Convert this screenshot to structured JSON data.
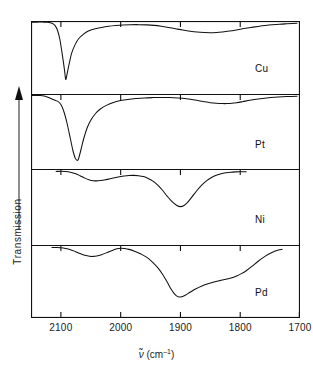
{
  "figure": {
    "y_axis_label": "Transmission",
    "x_axis_symbol": "ν",
    "x_axis_unit_open": " (cm",
    "x_axis_unit_exp": "–1",
    "x_axis_unit_close": ")",
    "x_axis_full": "ν̃ (cm–1)"
  },
  "chart_data": {
    "type": "line",
    "title": "",
    "xlabel": "ν̃ (cm–1)",
    "ylabel": "Transmission",
    "xlim": [
      2150,
      1700
    ],
    "x_reversed": true,
    "xticks": [
      2100,
      2000,
      1900,
      1800,
      1700
    ],
    "xtick_labels": [
      "2100",
      "2000",
      "1900",
      "1800",
      "1700"
    ],
    "ylim": [
      0,
      1
    ],
    "ytick_labels": [],
    "grid": false,
    "legend": "inline panel labels, right side",
    "panels": [
      {
        "name": "Cu",
        "label": "Cu",
        "x_start": 2150,
        "x_end": 1705,
        "peaks": [
          {
            "center": 2092,
            "depth": 0.82,
            "width": 14,
            "shape": "sharp"
          },
          {
            "center": 1847,
            "depth": 0.17,
            "width": 55,
            "shape": "broad"
          }
        ],
        "points_x": [
          2150,
          2140,
          2130,
          2122,
          2115,
          2110,
          2106,
          2102,
          2098,
          2094,
          2092,
          2090,
          2086,
          2082,
          2076,
          2070,
          2062,
          2054,
          2044,
          2032,
          2020,
          2008,
          1996,
          1984,
          1970,
          1956,
          1944,
          1932,
          1920,
          1908,
          1896,
          1884,
          1872,
          1860,
          1850,
          1840,
          1830,
          1818,
          1806,
          1794,
          1782,
          1770,
          1758,
          1746,
          1734,
          1722,
          1712,
          1705
        ],
        "points_y": [
          0.985,
          0.985,
          0.985,
          0.982,
          0.97,
          0.94,
          0.88,
          0.76,
          0.56,
          0.33,
          0.2,
          0.26,
          0.42,
          0.56,
          0.68,
          0.76,
          0.82,
          0.862,
          0.89,
          0.912,
          0.928,
          0.938,
          0.945,
          0.949,
          0.95,
          0.947,
          0.94,
          0.928,
          0.912,
          0.894,
          0.876,
          0.86,
          0.848,
          0.842,
          0.84,
          0.843,
          0.85,
          0.862,
          0.878,
          0.896,
          0.912,
          0.926,
          0.938,
          0.948,
          0.956,
          0.962,
          0.966,
          0.968
        ]
      },
      {
        "name": "Pt",
        "label": "Pt",
        "x_start": 2150,
        "x_end": 1705,
        "peaks": [
          {
            "center": 2072,
            "depth": 0.88,
            "width": 16,
            "shape": "sharp"
          },
          {
            "center": 1822,
            "depth": 0.14,
            "width": 45,
            "shape": "broad"
          }
        ],
        "points_x": [
          2150,
          2142,
          2134,
          2128,
          2122,
          2118,
          2114,
          2110,
          2106,
          2102,
          2098,
          2094,
          2090,
          2084,
          2080,
          2076,
          2072,
          2070,
          2066,
          2062,
          2056,
          2050,
          2042,
          2034,
          2024,
          2012,
          2000,
          1988,
          1974,
          1960,
          1946,
          1932,
          1918,
          1904,
          1890,
          1876,
          1862,
          1850,
          1840,
          1830,
          1822,
          1814,
          1806,
          1796,
          1784,
          1770,
          1756,
          1742,
          1728,
          1714,
          1705
        ],
        "points_y": [
          0.98,
          0.982,
          0.98,
          0.972,
          0.958,
          0.944,
          0.93,
          0.918,
          0.905,
          0.88,
          0.83,
          0.74,
          0.62,
          0.4,
          0.25,
          0.145,
          0.115,
          0.15,
          0.27,
          0.4,
          0.55,
          0.65,
          0.74,
          0.8,
          0.848,
          0.888,
          0.912,
          0.928,
          0.94,
          0.948,
          0.952,
          0.954,
          0.952,
          0.946,
          0.936,
          0.92,
          0.9,
          0.884,
          0.876,
          0.872,
          0.872,
          0.876,
          0.884,
          0.898,
          0.916,
          0.934,
          0.948,
          0.958,
          0.964,
          0.968,
          0.97
        ]
      },
      {
        "name": "Ni",
        "label": "Ni",
        "x_start": 2108,
        "x_end": 1790,
        "peaks": [
          {
            "center": 2048,
            "depth": 0.22,
            "width": 30,
            "shape": "broad"
          },
          {
            "center": 1900,
            "depth": 0.55,
            "width": 40,
            "shape": "medium"
          }
        ],
        "points_x": [
          2108,
          2100,
          2092,
          2084,
          2076,
          2068,
          2060,
          2052,
          2046,
          2040,
          2034,
          2026,
          2018,
          2010,
          2002,
          1994,
          1986,
          1978,
          1970,
          1962,
          1954,
          1946,
          1938,
          1930,
          1922,
          1914,
          1906,
          1900,
          1894,
          1888,
          1880,
          1872,
          1864,
          1856,
          1848,
          1840,
          1832,
          1824,
          1816,
          1808,
          1800,
          1794,
          1790
        ],
        "points_y": [
          0.968,
          0.97,
          0.968,
          0.958,
          0.94,
          0.912,
          0.88,
          0.856,
          0.846,
          0.844,
          0.848,
          0.858,
          0.872,
          0.886,
          0.898,
          0.908,
          0.914,
          0.916,
          0.912,
          0.9,
          0.876,
          0.84,
          0.788,
          0.72,
          0.64,
          0.57,
          0.52,
          0.505,
          0.52,
          0.56,
          0.64,
          0.72,
          0.79,
          0.846,
          0.888,
          0.918,
          0.938,
          0.95,
          0.958,
          0.962,
          0.964,
          0.964,
          0.963
        ]
      },
      {
        "name": "Pd",
        "label": "Pd",
        "x_start": 2115,
        "x_end": 1730,
        "peaks": [
          {
            "center": 2050,
            "depth": 0.2,
            "width": 28,
            "shape": "shallow"
          },
          {
            "center": 1905,
            "depth": 0.88,
            "width": 32,
            "shape": "deep-broad"
          }
        ],
        "points_x": [
          2115,
          2108,
          2100,
          2092,
          2084,
          2076,
          2068,
          2060,
          2052,
          2046,
          2040,
          2032,
          2024,
          2014,
          2006,
          2000,
          1994,
          1986,
          1976,
          1966,
          1956,
          1946,
          1938,
          1930,
          1922,
          1916,
          1910,
          1906,
          1902,
          1898,
          1892,
          1884,
          1874,
          1864,
          1854,
          1844,
          1834,
          1824,
          1814,
          1806,
          1798,
          1790,
          1780,
          1770,
          1758,
          1746,
          1736,
          1730
        ],
        "points_y": [
          0.966,
          0.966,
          0.962,
          0.952,
          0.936,
          0.912,
          0.884,
          0.86,
          0.846,
          0.844,
          0.85,
          0.868,
          0.892,
          0.926,
          0.948,
          0.955,
          0.952,
          0.94,
          0.912,
          0.876,
          0.83,
          0.76,
          0.69,
          0.6,
          0.49,
          0.4,
          0.33,
          0.3,
          0.288,
          0.29,
          0.312,
          0.352,
          0.4,
          0.438,
          0.468,
          0.492,
          0.512,
          0.53,
          0.552,
          0.576,
          0.608,
          0.648,
          0.71,
          0.778,
          0.848,
          0.902,
          0.932,
          0.94
        ]
      }
    ]
  },
  "panel_labels": {
    "cu": "Cu",
    "pt": "Pt",
    "ni": "Ni",
    "pd": "Pd"
  },
  "colors": {
    "line": "#111111",
    "frame": "#111111",
    "background": "#ffffff"
  }
}
